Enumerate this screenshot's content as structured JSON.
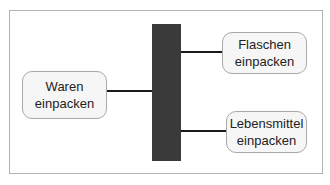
{
  "diagram": {
    "type": "hierarchy",
    "root": {
      "line1": "Waren",
      "line2": "einpacken"
    },
    "children": [
      {
        "line1": "Flaschen",
        "line2": "einpacken"
      },
      {
        "line1": "Lebensmittel",
        "line2": "einpacken"
      }
    ]
  },
  "colors": {
    "bar": "#3a3a3a",
    "node_fill": "#f6f6f6",
    "node_border": "#a8a8a8",
    "connector": "#1a1a1a",
    "frame_border": "#b4b4b4"
  }
}
